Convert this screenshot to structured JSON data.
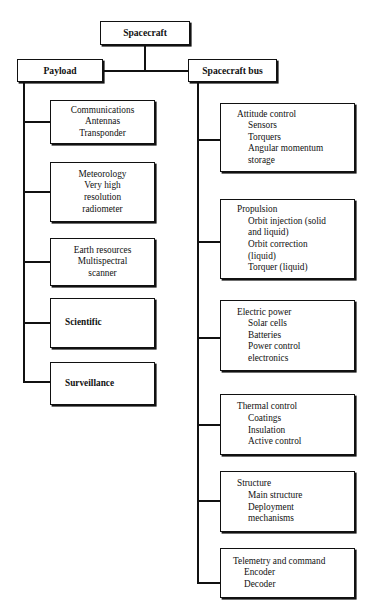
{
  "diagram": {
    "type": "tree-hierarchy",
    "root": {
      "label": "Spacecraft"
    },
    "branches": [
      {
        "label": "Payload"
      },
      {
        "label": "Spacecraft bus"
      }
    ],
    "payload_children": [
      {
        "lines": [
          "Communications",
          "Antennas",
          "Transponder"
        ],
        "bold": false
      },
      {
        "lines": [
          "Meteorology",
          "Very high",
          "resolution",
          "radiometer"
        ],
        "bold": false
      },
      {
        "lines": [
          "Earth resources",
          "Multispectral",
          "scanner"
        ],
        "bold": false
      },
      {
        "lines": [
          "Scientific"
        ],
        "bold": true
      },
      {
        "lines": [
          "Surveillance"
        ],
        "bold": true
      }
    ],
    "bus_children": [
      {
        "head": "Attitude control",
        "subs": [
          "Sensors",
          "Torquers",
          "Angular momentum",
          "storage"
        ]
      },
      {
        "head": "Propulsion",
        "subs": [
          "Orbit injection (solid",
          "and liquid)",
          "Orbit correction",
          "(liquid)",
          "Torquer (liquid)"
        ]
      },
      {
        "head": "Electric power",
        "subs": [
          "Solar cells",
          "Batteries",
          "Power control",
          "electronics"
        ]
      },
      {
        "head": "Thermal control",
        "subs": [
          "Coatings",
          "Insulation",
          "Active control"
        ]
      },
      {
        "head": "Structure",
        "subs": [
          "Main structure",
          "Deployment",
          "mechanisms"
        ]
      },
      {
        "head": "Telemetry and command",
        "subs": [
          "Encoder",
          "Decoder"
        ]
      }
    ],
    "colors": {
      "line": "#111111",
      "background": "#ffffff"
    }
  }
}
